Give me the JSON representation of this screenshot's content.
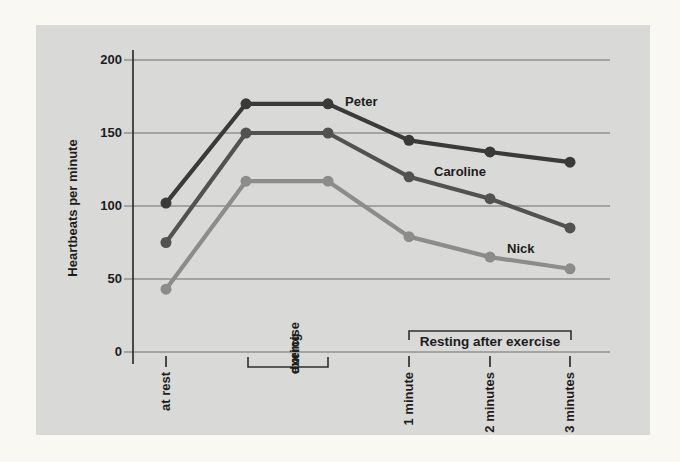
{
  "page": {
    "background_color": "#faf8f2",
    "panel_color": "#d9d9d7"
  },
  "chart_data": {
    "type": "line",
    "title": "",
    "y_axis_title": "Heartbeats per minute",
    "xlabel": "",
    "ylabel": "Heartbeats per minute",
    "ylim": [
      0,
      200
    ],
    "y_ticks": [
      200,
      150,
      100,
      50,
      0
    ],
    "grid": true,
    "legend_position": "inline-labels",
    "categories": [
      "at rest",
      "during exercise",
      "during exercise",
      "1 minute",
      "2 minutes",
      "3 minutes"
    ],
    "x_tick_labels": [
      "at rest",
      "1 minute",
      "2 minutes",
      "3 minutes"
    ],
    "during_label": [
      "during",
      "exercise"
    ],
    "resting_label": "Resting after exercise",
    "series": [
      {
        "name": "Peter",
        "color": "#3a3a3a",
        "values": [
          102,
          170,
          170,
          145,
          137,
          130
        ]
      },
      {
        "name": "Caroline",
        "color": "#525252",
        "values": [
          75,
          150,
          150,
          120,
          105,
          85
        ]
      },
      {
        "name": "Nick",
        "color": "#8c8c8c",
        "values": [
          43,
          117,
          117,
          79,
          65,
          57
        ]
      }
    ],
    "gridline_color": "#6e6e6e",
    "axis_color": "#2f2f2f",
    "text_color": "#1d1d1d"
  }
}
